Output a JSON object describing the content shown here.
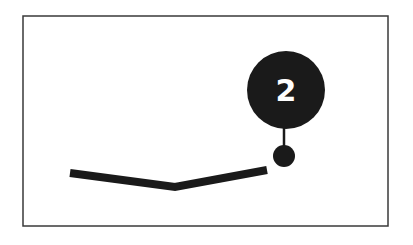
{
  "diagram": {
    "frame": {
      "x": 23,
      "y": 16,
      "width": 365,
      "height": 210,
      "stroke": "#3a3a3a"
    },
    "polyline": {
      "points": "70,173 175,187 267,170",
      "stroke": "#1a1a1a",
      "width": 8
    },
    "marker_dot": {
      "cx": 284,
      "cy": 156,
      "r": 11,
      "fill": "#1a1a1a"
    },
    "callout": {
      "cx": 286,
      "cy": 90,
      "r": 39,
      "fill": "#1a1a1a",
      "label": "2",
      "label_color": "#ffffff",
      "stem": {
        "x1": 284,
        "y1": 128,
        "x2": 284,
        "y2": 146
      }
    }
  }
}
